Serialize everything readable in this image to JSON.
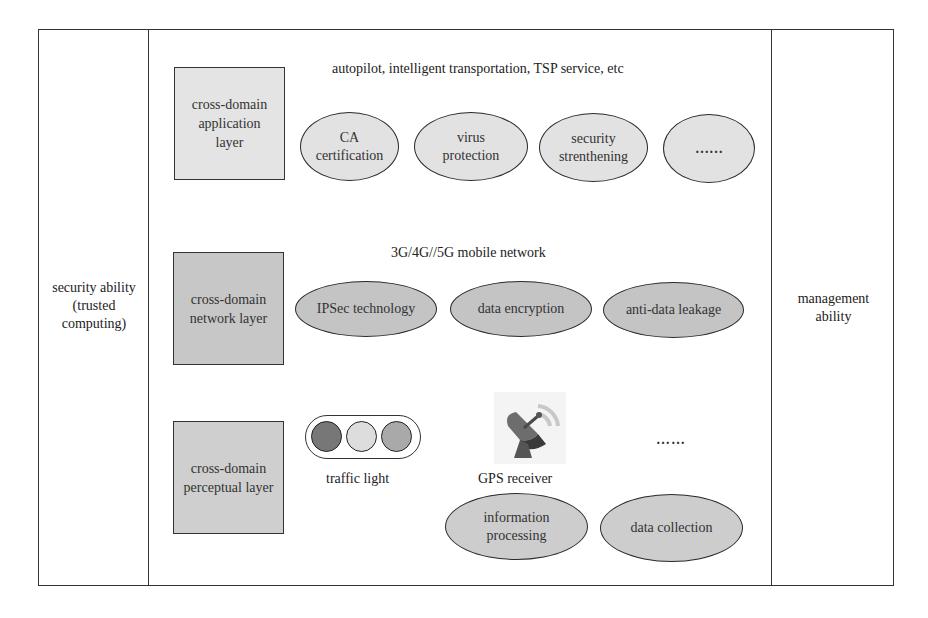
{
  "diagram": {
    "left_panel": {
      "label_lines": [
        "security ability",
        "(trusted",
        "computing)"
      ]
    },
    "right_panel": {
      "label_lines": [
        "management",
        "ability"
      ]
    },
    "layers": [
      {
        "id": "application",
        "box_lines": [
          "cross-domain",
          "application",
          "layer"
        ],
        "box_color": "#e4e4e4",
        "caption": "autopilot, intelligent transportation, TSP service, etc",
        "ellipse_color": "#e2e2e2",
        "items": [
          {
            "lines": [
              "CA",
              "certification"
            ]
          },
          {
            "lines": [
              "virus",
              "protection"
            ]
          },
          {
            "lines": [
              "security",
              "strenthening"
            ]
          },
          {
            "lines": [
              "……"
            ]
          }
        ]
      },
      {
        "id": "network",
        "box_lines": [
          "cross-domain",
          "network layer"
        ],
        "box_color": "#c7c7c7",
        "caption": "3G/4G//5G mobile network",
        "ellipse_color": "#c4c4c4",
        "items": [
          {
            "lines": [
              "IPSec technology"
            ]
          },
          {
            "lines": [
              "data encryption"
            ]
          },
          {
            "lines": [
              "anti-data leakage"
            ]
          }
        ]
      },
      {
        "id": "perceptual",
        "box_lines": [
          "cross-domain",
          "perceptual layer"
        ],
        "box_color": "#cfcfcf",
        "ellipse_color": "#cdcdcd",
        "devices": [
          {
            "label": "traffic light",
            "icon": "traffic-light-icon",
            "light_colors": [
              "#777777",
              "#dddddd",
              "#a9a9a9"
            ]
          },
          {
            "label": "GPS receiver",
            "icon": "satellite-dish-icon"
          }
        ],
        "more": "……",
        "items": [
          {
            "lines": [
              "information",
              "processing"
            ]
          },
          {
            "lines": [
              "data collection"
            ]
          }
        ]
      }
    ]
  }
}
